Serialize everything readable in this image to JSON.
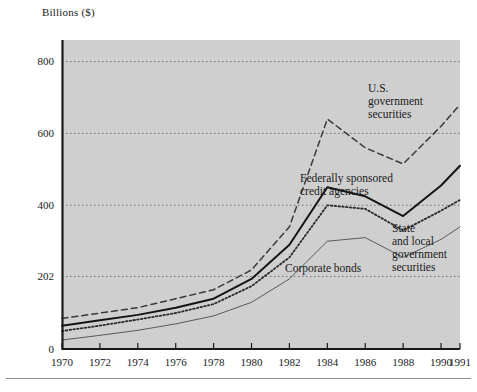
{
  "figure": {
    "axis_caption": "Billions ($)",
    "background_color": "#cfcfcf",
    "axis_color": "#1a1a1a",
    "gridline_color": "#707070"
  },
  "annotations": {
    "us_government_securities": "U.S.\ngovernment\nsecurities",
    "federally_sponsored_credit_agencies": "Federally sponsored\ncredit agencies",
    "state_and_local_government_securities": "State\nand local\ngovernment\nsecurities",
    "corporate_bonds": "Corporate bonds"
  },
  "chart_data": {
    "type": "line",
    "title": "",
    "subtitle": "",
    "xlabel": "",
    "ylabel": "Billions ($)",
    "grid": true,
    "legend_position": "inline-annotations",
    "xlim": [
      1970,
      1991
    ],
    "ylim": [
      0,
      860
    ],
    "ytick_labels": [
      "0",
      "202",
      "400",
      "600",
      "800"
    ],
    "ytick_values": [
      0,
      202,
      400,
      600,
      800
    ],
    "xtick_labels": [
      "1970",
      "1972",
      "1974",
      "1976",
      "1978",
      "1980",
      "1982",
      "1984",
      "1986",
      "1988",
      "1990",
      "1991"
    ],
    "x": [
      1970,
      1972,
      1974,
      1976,
      1978,
      1980,
      1982,
      1984,
      1986,
      1988,
      1990,
      1991
    ],
    "series": [
      {
        "name": "U.S. government securities",
        "style": "dashed",
        "values": [
          85,
          100,
          115,
          140,
          165,
          220,
          340,
          640,
          560,
          515,
          620,
          680
        ]
      },
      {
        "name": "Federally sponsored credit agencies",
        "style": "solid-thick",
        "values": [
          65,
          80,
          95,
          115,
          140,
          195,
          290,
          450,
          425,
          370,
          455,
          510
        ]
      },
      {
        "name": "Corporate bonds",
        "style": "dotted",
        "values": [
          50,
          65,
          82,
          100,
          125,
          175,
          255,
          400,
          390,
          330,
          385,
          415
        ]
      },
      {
        "name": "State and local government securities",
        "style": "solid-thin",
        "values": [
          25,
          38,
          52,
          70,
          92,
          130,
          195,
          300,
          310,
          255,
          305,
          340
        ]
      }
    ]
  }
}
